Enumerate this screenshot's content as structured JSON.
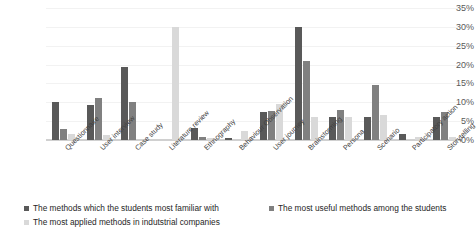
{
  "chart_data": {
    "type": "bar",
    "title": "",
    "xlabel": "",
    "ylabel": "",
    "ylim": [
      0,
      35
    ],
    "ytick_labels": [
      "35%",
      "30%",
      "25%",
      "20%",
      "15%",
      "10%",
      "5%",
      "0%"
    ],
    "ytick_values": [
      35,
      30,
      25,
      20,
      15,
      10,
      5,
      0
    ],
    "grid": true,
    "legend_position": "bottom",
    "categories": [
      "Questionnaire",
      "User interview",
      "Case study",
      "Literature review",
      "Ethnography",
      "Behaviour Observation",
      "User journey",
      "Brainstorming",
      "Persona",
      "Scenario",
      "Participatory action",
      "Storytelling"
    ],
    "series": [
      {
        "name": "The methods which the students most familiar with",
        "color": "#595959",
        "values": [
          10,
          9.3,
          19.3,
          0,
          3.2,
          0.6,
          7.3,
          30,
          6.2,
          6.2,
          1.5,
          6.2
        ]
      },
      {
        "name": "The most useful methods among the students",
        "color": "#808080",
        "values": [
          3,
          11.2,
          10,
          0,
          0.7,
          0,
          7.8,
          21,
          8,
          14.5,
          0,
          7.3
        ]
      },
      {
        "name": "The most applied methods in indutstrial companies",
        "color": "#d9d9d9",
        "values": [
          1.5,
          1.4,
          0,
          30,
          0.6,
          2.5,
          9.6,
          6.2,
          6.2,
          6.6,
          0.8,
          0.8
        ]
      }
    ]
  },
  "legend": {
    "items": [
      {
        "label": "The methods which the students most familiar with",
        "color": "#595959"
      },
      {
        "label": "The most useful methods among the students",
        "color": "#808080"
      },
      {
        "label": "The most applied methods in indutstrial companies",
        "color": "#d9d9d9"
      }
    ]
  }
}
